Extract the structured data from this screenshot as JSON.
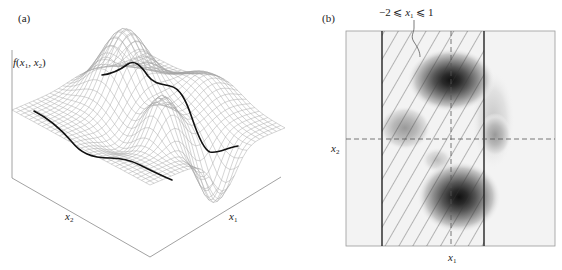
{
  "panel_a": {
    "tag": "(a)",
    "z_label": {
      "f": "f",
      "open": "(",
      "x1": "x",
      "s1": "1",
      "comma": ", ",
      "x2": "x",
      "s2": "2",
      "close": ")"
    },
    "x1_label": {
      "x": "x",
      "sub": "1"
    },
    "x2_label": {
      "x": "x",
      "sub": "2"
    },
    "description": "3D wireframe surface plot of f(x1, x2) with peaks and a deep valley; two bold cross-section curves"
  },
  "panel_b": {
    "tag": "(b)",
    "constraint_label": {
      "pre": "−2 ⩽ ",
      "x": "x",
      "sub": "1",
      "post": " ⩽ 1"
    },
    "x1_label": {
      "x": "x",
      "sub": "1"
    },
    "x2_label": {
      "x": "x",
      "sub": "2"
    },
    "description": "Grayscale contour map of f(x1, x2) with hatched band for -2 <= x1 <= 1, dashed crosshair lines"
  },
  "colors": {
    "wire": "#9a9a9a",
    "bold_curve": "#111111",
    "axis": "#777777",
    "hatch": "#333333",
    "band_edge": "#222222"
  },
  "chart_data": [
    {
      "type": "surface",
      "title": "(a)",
      "zlabel": "f(x1, x2)",
      "xlabel": "x1",
      "ylabel": "x2",
      "features": [
        "two tall peaks",
        "one smaller peak",
        "deep valley near front",
        "two bold cross-section curves"
      ]
    },
    {
      "type": "heatmap",
      "title": "(b)",
      "xlabel": "x1",
      "ylabel": "x2",
      "annotation": "-2 <= x1 <= 1",
      "shaded_band": {
        "x1_min": -2,
        "x1_max": 1,
        "pattern": "diagonal hatch"
      },
      "dashed_lines": [
        "vertical at band center",
        "horizontal across plot"
      ],
      "blobs": [
        {
          "position": "upper center",
          "intensity": "dark"
        },
        {
          "position": "lower center",
          "intensity": "dark"
        },
        {
          "position": "mid left",
          "intensity": "light"
        },
        {
          "position": "mid right",
          "intensity": "light"
        },
        {
          "position": "center",
          "intensity": "faint"
        }
      ]
    }
  ]
}
